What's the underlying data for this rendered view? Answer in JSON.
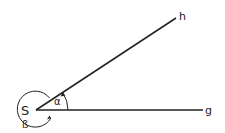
{
  "diagram": {
    "vertex_label": "S",
    "ray_labels": {
      "g": "g",
      "h": "h"
    },
    "angle_labels": {
      "alpha": "α",
      "beta": "ß"
    },
    "colors": {
      "stroke": "#222222",
      "background": "#ffffff"
    }
  }
}
